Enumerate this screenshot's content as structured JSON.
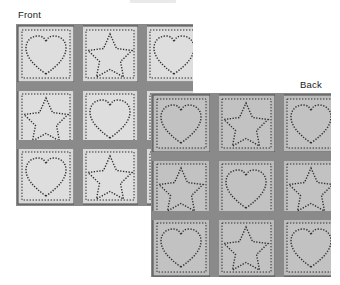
{
  "page": {
    "background_color": "#ffffff",
    "width": 340,
    "height": 285
  },
  "labels": {
    "front": "Front",
    "back": "Back"
  },
  "palette": {
    "front_block_fill": "#d9d9d9",
    "front_block_inner": "#dedede",
    "back_block_fill": "#bcbcbc",
    "back_block_inner": "#c2c2c2",
    "sashing": "#8a8a8a",
    "sashing_dark": "#7e7e7e",
    "stitch": "#2f2f2f",
    "outline": "#3a3a3a",
    "text": "#1a1a1a"
  },
  "diagram": {
    "type": "quilt-layout-diagram",
    "panels": [
      {
        "id": "front",
        "label": "Front",
        "rows": 3,
        "cols": 3,
        "z_order": 1,
        "blocks": [
          [
            "heart",
            "star",
            "heart"
          ],
          [
            "star",
            "heart",
            "heart"
          ],
          [
            "heart",
            "star",
            "star"
          ]
        ]
      },
      {
        "id": "back",
        "label": "Back",
        "rows": 3,
        "cols": 3,
        "z_order": 2,
        "blocks": [
          [
            "heart",
            "star",
            "heart"
          ],
          [
            "star",
            "heart",
            "star"
          ],
          [
            "heart",
            "star",
            "heart"
          ]
        ]
      }
    ],
    "motifs": {
      "heart": "heart-motif",
      "star": "star-motif"
    },
    "sashing": {
      "vertical_strips": 2,
      "horizontal_strips": 2,
      "description": "dark gray strips separating blocks"
    }
  }
}
